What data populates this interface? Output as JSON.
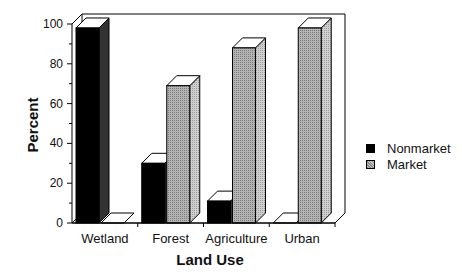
{
  "chart_data": {
    "type": "bar",
    "style": "3d-grouped",
    "title": "",
    "xlabel": "Land Use",
    "ylabel": "Percent",
    "ylim": [
      0,
      100
    ],
    "yticks": [
      0,
      20,
      40,
      60,
      80,
      100
    ],
    "categories": [
      "Wetland",
      "Forest",
      "Agriculture",
      "Urban"
    ],
    "series": [
      {
        "name": "Nonmarket",
        "values": [
          98,
          30,
          11,
          0
        ],
        "color": "#000000"
      },
      {
        "name": "Market",
        "values": [
          0,
          69,
          88,
          98
        ],
        "color": "#a8a8a8"
      }
    ],
    "grid": false,
    "legend_position": "right"
  },
  "axes": {
    "xlabel": "Land Use",
    "ylabel": "Percent",
    "yticks": [
      "0",
      "20",
      "40",
      "60",
      "80",
      "100"
    ],
    "categories": [
      "Wetland",
      "Forest",
      "Agriculture",
      "Urban"
    ]
  },
  "legend": {
    "items": [
      {
        "label": "Nonmarket",
        "color": "#000000"
      },
      {
        "label": "Market",
        "color": "#a8a8a8"
      }
    ]
  }
}
